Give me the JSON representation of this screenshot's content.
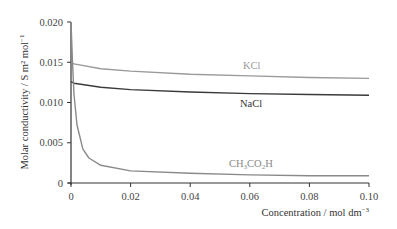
{
  "chart_data": {
    "type": "line",
    "title": "",
    "xlabel": "Concentration / mol dm⁻³",
    "ylabel": "Molar conductivity / S m² mol⁻¹",
    "xlim": [
      0,
      0.1
    ],
    "ylim": [
      0,
      0.02
    ],
    "x_ticks": [
      "0",
      "0.02",
      "0.04",
      "0.06",
      "0.08",
      "0.10"
    ],
    "y_ticks": [
      "0",
      "0.005",
      "0.010",
      "0.015",
      "0.020"
    ],
    "grid": false,
    "legend": "inline labels",
    "series": [
      {
        "name": "KCl",
        "color": "#9a9a9a",
        "x": [
          0,
          0.001,
          0.01,
          0.02,
          0.04,
          0.06,
          0.08,
          0.1
        ],
        "values": [
          0.015,
          0.0148,
          0.0142,
          0.0139,
          0.0135,
          0.0133,
          0.0131,
          0.013
        ]
      },
      {
        "name": "NaCl",
        "color": "#3a3a3a",
        "x": [
          0,
          0.001,
          0.01,
          0.02,
          0.04,
          0.06,
          0.08,
          0.1
        ],
        "values": [
          0.0126,
          0.0124,
          0.0119,
          0.0116,
          0.0113,
          0.0111,
          0.011,
          0.0109
        ]
      },
      {
        "name": "CH₃CO₂H",
        "color": "#8a8a8a",
        "x": [
          0,
          0.0005,
          0.001,
          0.002,
          0.004,
          0.006,
          0.01,
          0.02,
          0.04,
          0.06,
          0.08,
          0.1
        ],
        "values": [
          0.02,
          0.015,
          0.011,
          0.0072,
          0.0042,
          0.0031,
          0.0022,
          0.0015,
          0.0012,
          0.001,
          0.0009,
          0.0009
        ]
      }
    ]
  },
  "labels": {
    "kcl": "KCl",
    "nacl": "NaCl",
    "acetic": "CH3CO2H",
    "xaxis": "Concentration / mol dm",
    "xaxis_sup": "−3",
    "yaxis": "Molar conductivity / S m² mol",
    "yaxis_sup": "−1"
  }
}
